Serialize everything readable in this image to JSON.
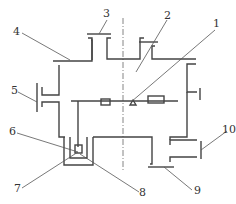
{
  "figure": {
    "type": "schematic",
    "colors": {
      "line": "#444444",
      "leader": "#555555",
      "text": "#333333",
      "background": "#ffffff"
    },
    "callouts": [
      {
        "id": "c1",
        "number": "1"
      },
      {
        "id": "c2",
        "number": "2"
      },
      {
        "id": "c3",
        "number": "3"
      },
      {
        "id": "c4",
        "number": "4"
      },
      {
        "id": "c5",
        "number": "5"
      },
      {
        "id": "c6",
        "number": "6"
      },
      {
        "id": "c7",
        "number": "7"
      },
      {
        "id": "c8",
        "number": "8"
      },
      {
        "id": "c9",
        "number": "9"
      },
      {
        "id": "c10",
        "number": "10"
      }
    ]
  }
}
